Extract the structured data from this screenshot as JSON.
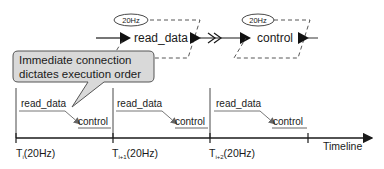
{
  "diagram": {
    "top_flow": {
      "block1": {
        "label": "read_data",
        "rate": "20Hz"
      },
      "connector": {
        "symbol": "double-chevron-immediate"
      },
      "block2": {
        "label": "control",
        "rate": "20Hz"
      }
    },
    "callout": {
      "line1": "Immediate connection",
      "line2": "dictates execution order"
    },
    "timeline": {
      "axis_label": "Timeline",
      "ticks": [
        {
          "base": "T",
          "sub": "i",
          "suffix": "(20Hz)"
        },
        {
          "base": "T",
          "sub": "i+1",
          "suffix": "(20Hz)"
        },
        {
          "base": "T",
          "sub": "i+2",
          "suffix": "(20Hz)"
        }
      ],
      "slots": [
        {
          "first": "read_data",
          "second": "control"
        },
        {
          "first": "read_data",
          "second": "control"
        },
        {
          "first": "read_data",
          "second": "control"
        }
      ]
    },
    "colors": {
      "line": "#1a1a1a",
      "callout_fill": "#d9d9d9",
      "callout_stroke": "#555555",
      "dashed": "#444444"
    }
  }
}
